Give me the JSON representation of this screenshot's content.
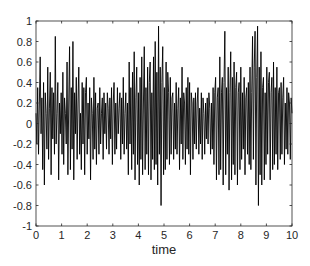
{
  "chart_data": {
    "type": "line",
    "title": "",
    "xlabel": "time",
    "ylabel": "",
    "xlim": [
      0,
      10
    ],
    "ylim": [
      -1,
      1
    ],
    "grid": false,
    "legend": null,
    "x_ticks": [
      "0",
      "1",
      "2",
      "3",
      "4",
      "5",
      "6",
      "7",
      "8",
      "9",
      "10"
    ],
    "y_ticks": [
      "1",
      "0.8",
      "0.6",
      "0.4",
      "0.2",
      "0",
      "-0.2",
      "-0.4",
      "-0.6",
      "-0.8",
      "-1"
    ],
    "line_color": "#000000",
    "series": [
      {
        "name": "signal",
        "x_start": 0,
        "x_end": 10,
        "values": [
          0.1,
          -0.2,
          0.35,
          -0.3,
          0.2,
          0.65,
          -0.1,
          0.25,
          -0.45,
          0.4,
          -0.6,
          0.3,
          0.1,
          -0.25,
          0.55,
          -0.35,
          0.15,
          0.5,
          -0.5,
          0.35,
          -0.15,
          0.3,
          -0.3,
          0.85,
          -0.2,
          0.1,
          0.4,
          -0.55,
          0.2,
          -0.1,
          0.3,
          -0.3,
          0.5,
          -0.4,
          0.25,
          0.1,
          -0.2,
          0.6,
          -0.5,
          0.2,
          0.75,
          -0.45,
          0.35,
          -0.25,
          0.8,
          -0.55,
          0.3,
          -0.1,
          0.45,
          -0.35,
          0.2,
          0.55,
          -0.3,
          0.1,
          -0.45,
          0.4,
          -0.2,
          0.35,
          -0.5,
          0.3,
          0.45,
          -0.3,
          0.2,
          -0.15,
          0.35,
          -0.55,
          0.25,
          0.1,
          -0.35,
          0.45,
          -0.25,
          0.3,
          -0.4,
          0.15,
          0.2,
          -0.3,
          0.35,
          -0.2,
          0.1,
          0.25,
          -0.35,
          0.3,
          -0.1,
          0.2,
          -0.25,
          0.3,
          0.15,
          -0.3,
          0.25,
          -0.15,
          0.35,
          -0.4,
          0.2,
          0.4,
          -0.3,
          0.2,
          -0.25,
          0.35,
          -0.1,
          0.15,
          0.3,
          -0.35,
          0.25,
          -0.2,
          0.45,
          -0.3,
          0.1,
          0.3,
          -0.25,
          0.2,
          -0.5,
          0.6,
          -0.2,
          0.35,
          -0.45,
          0.5,
          -0.3,
          0.7,
          -0.55,
          0.25,
          0.55,
          -0.4,
          0.3,
          -0.6,
          0.45,
          -0.35,
          0.65,
          -0.5,
          0.2,
          0.75,
          -0.45,
          0.35,
          -0.3,
          0.55,
          -0.5,
          0.4,
          0.6,
          -0.55,
          0.3,
          -0.35,
          0.65,
          -0.45,
          0.8,
          -0.4,
          0.5,
          -0.6,
          0.95,
          -0.3,
          0.55,
          -0.8,
          0.4,
          0.75,
          -0.5,
          0.35,
          -0.45,
          0.6,
          -0.35,
          0.5,
          0.3,
          -0.4,
          0.45,
          -0.3,
          0.25,
          0.3,
          -0.35,
          0.2,
          -0.25,
          0.4,
          -0.3,
          0.15,
          0.35,
          -0.45,
          0.25,
          -0.2,
          0.55,
          -0.35,
          0.3,
          0.2,
          -0.4,
          0.35,
          -0.25,
          0.45,
          -0.3,
          0.4,
          -0.5,
          0.3,
          0.2,
          -0.35,
          0.25,
          -0.2,
          0.3,
          -0.25,
          0.2,
          0.35,
          -0.3,
          0.15,
          -0.2,
          0.3,
          -0.35,
          0.25,
          0.1,
          -0.3,
          0.2,
          -0.15,
          0.25,
          -0.2,
          0.3,
          0.15,
          -0.3,
          0.2,
          -0.25,
          0.35,
          -0.4,
          0.3,
          0.45,
          -0.55,
          0.25,
          0.35,
          -0.5,
          0.65,
          -0.45,
          0.3,
          0.45,
          -0.6,
          0.4,
          0.9,
          -0.5,
          0.35,
          -0.3,
          0.55,
          -0.65,
          0.3,
          0.7,
          -0.55,
          0.45,
          -0.4,
          0.6,
          -0.5,
          0.35,
          0.5,
          -0.6,
          0.3,
          0.4,
          -0.45,
          0.55,
          -0.35,
          0.3,
          -0.25,
          0.45,
          -0.5,
          0.25,
          0.35,
          -0.3,
          0.4,
          -0.4,
          0.55,
          -0.45,
          0.3,
          0.85,
          -0.35,
          0.55,
          0.9,
          -0.6,
          0.45,
          0.95,
          -0.8,
          0.55,
          -0.5,
          0.7,
          -0.6,
          0.35,
          0.45,
          -0.55,
          0.3,
          -0.4,
          0.55,
          -0.3,
          0.4,
          0.5,
          -0.55,
          0.3,
          0.45,
          -0.45,
          0.6,
          -0.4,
          0.35,
          -0.3,
          0.55,
          -0.45,
          0.3,
          0.35,
          -0.35,
          0.4,
          -0.3,
          0.25,
          0.45,
          -0.4,
          0.2,
          -0.25,
          0.35,
          -0.3,
          0.3,
          0.2,
          -0.35,
          0.25,
          0.1
        ]
      }
    ]
  }
}
